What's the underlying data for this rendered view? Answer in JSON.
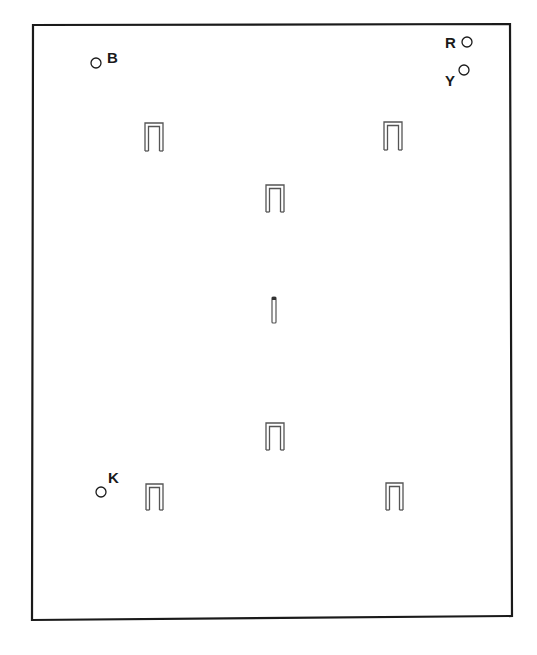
{
  "diagram": {
    "type": "croquet-court-layout",
    "background": "#ffffff",
    "line_color": "#1a1a1a",
    "hoop_color": "#555555",
    "court_boundary": {
      "corners": [
        [
          33,
          25
        ],
        [
          510,
          24
        ],
        [
          512,
          616
        ],
        [
          32,
          620
        ]
      ]
    },
    "balls": [
      {
        "id": "B",
        "label": "B",
        "circle": [
          96,
          63
        ],
        "label_pos": [
          107,
          50
        ]
      },
      {
        "id": "R",
        "label": "R",
        "circle": [
          467,
          42
        ],
        "label_pos": [
          445,
          35
        ]
      },
      {
        "id": "Y",
        "label": "Y",
        "circle": [
          464,
          70
        ],
        "label_pos": [
          445,
          73
        ]
      },
      {
        "id": "K",
        "label": "K",
        "circle": [
          101,
          492
        ],
        "label_pos": [
          108,
          470
        ]
      }
    ],
    "hoops": [
      {
        "name": "hoop-top-left",
        "x": 145,
        "y": 123,
        "w": 18,
        "h": 28
      },
      {
        "name": "hoop-top-right",
        "x": 384,
        "y": 122,
        "w": 18,
        "h": 28
      },
      {
        "name": "hoop-upper-center",
        "x": 266,
        "y": 185,
        "w": 18,
        "h": 27
      },
      {
        "name": "hoop-lower-center",
        "x": 266,
        "y": 423,
        "w": 18,
        "h": 27
      },
      {
        "name": "hoop-bottom-left",
        "x": 146,
        "y": 484,
        "w": 17,
        "h": 26
      },
      {
        "name": "hoop-bottom-right",
        "x": 386,
        "y": 483,
        "w": 17,
        "h": 27
      }
    ],
    "center_peg": {
      "x": 272,
      "y": 297,
      "w": 4,
      "h": 26
    }
  }
}
